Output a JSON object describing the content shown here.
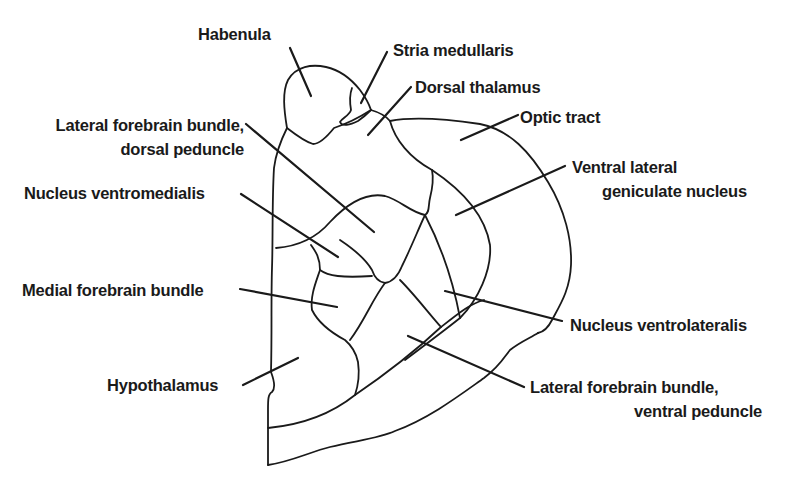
{
  "diagram": {
    "type": "anatomical brain section (labeled line drawing)",
    "colors": {
      "ink": "#1a1a1a",
      "background": "#ffffff"
    },
    "labels": {
      "habenula": {
        "lines": [
          "Habenula"
        ]
      },
      "stria_medullaris": {
        "lines": [
          "Stria medullaris"
        ]
      },
      "dorsal_thalamus": {
        "lines": [
          "Dorsal thalamus"
        ]
      },
      "optic_tract": {
        "lines": [
          "Optic tract"
        ]
      },
      "lfb_dorsal": {
        "lines": [
          "Lateral forebrain bundle,",
          "dorsal peduncle"
        ]
      },
      "ventral_lateral_geniculate": {
        "lines": [
          "Ventral lateral",
          "geniculate nucleus"
        ]
      },
      "nucleus_ventromedialis": {
        "lines": [
          "Nucleus ventromedialis"
        ]
      },
      "medial_forebrain_bundle": {
        "lines": [
          "Medial forebrain bundle"
        ]
      },
      "nucleus_ventrolateralis": {
        "lines": [
          "Nucleus ventrolateralis"
        ]
      },
      "hypothalamus": {
        "lines": [
          "Hypothalamus"
        ]
      },
      "lfb_ventral": {
        "lines": [
          "Lateral forebrain bundle,",
          "ventral peduncle"
        ]
      }
    }
  }
}
